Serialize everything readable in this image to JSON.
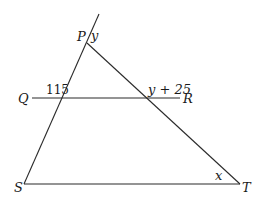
{
  "diagram": {
    "points": {
      "P": {
        "label": "P"
      },
      "Q": {
        "label": "Q"
      },
      "R": {
        "label": "R"
      },
      "S": {
        "label": "S"
      },
      "T": {
        "label": "T"
      }
    },
    "angles": {
      "at_P": "y",
      "at_QR_PS": "115",
      "at_QR_PT": "y + 25",
      "at_T": "x"
    },
    "segments": [
      "PS (extended beyond P)",
      "PT",
      "QR",
      "ST"
    ],
    "colors": {
      "line": "#2a2a2a",
      "text": "#1a1a1a",
      "background": "#ffffff"
    }
  }
}
